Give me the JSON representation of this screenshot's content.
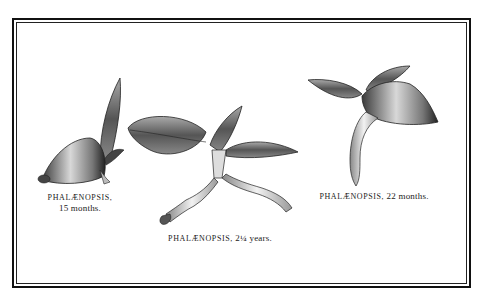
{
  "figures": [
    {
      "name": "PHALÆNOPSIS,",
      "age": "15 months."
    },
    {
      "name": "PHALÆNOPSIS,",
      "age": "2¼ years."
    },
    {
      "name": "PHALÆNOPSIS,",
      "age": "22 months."
    }
  ],
  "colors": {
    "ink": "#222222",
    "paper": "#ffffff",
    "frame": "#111111"
  }
}
